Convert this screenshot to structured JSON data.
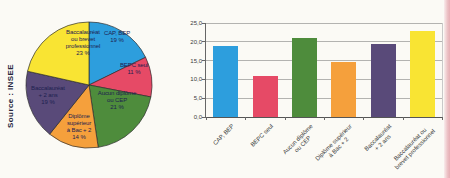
{
  "source_label": "Source : INSEE",
  "pie_slice_labels": [
    "CAP, BEP\n19 %",
    "BEPC seul\n11 %",
    "Aucun diplôme\nou CEP\n21 %",
    "Diplôme\nsupérieur\nà Bac + 2\n14 %",
    "Baccalauréat\n+ 2 ans\n19 %",
    "Baccalauréat\nou brevet\nprofessionnel\n23 %"
  ],
  "chart_data": [
    {
      "type": "pie",
      "labels": [
        "CAP, BEP",
        "BEPC seul",
        "Aucun diplôme ou CEP",
        "Diplôme supérieur à Bac + 2",
        "Baccalauréat + 2 ans",
        "Baccalauréat ou brevet professionnel"
      ],
      "values": [
        19,
        11,
        21,
        14,
        19,
        23
      ],
      "unit": "%",
      "colors": [
        "#2d9edd",
        "#e64a66",
        "#4e8c3c",
        "#f5a03c",
        "#594a79",
        "#f9e433"
      ],
      "outline_color": "#2e2e2e",
      "label_text_color": "#1d2150",
      "legend": "none",
      "note": "percentages printed inside slices"
    },
    {
      "type": "bar",
      "categories": [
        "CAP, BEP",
        "BEPC seul",
        "Aucun diplôme ou CEP",
        "Diplôme supérieur à Bac + 2",
        "Baccalauréat + 2 ans",
        "Baccalauréat ou brevet professionnel"
      ],
      "values": [
        19,
        11,
        21,
        14.5,
        19.5,
        23
      ],
      "colors": [
        "#2d9edd",
        "#e64a66",
        "#4e8c3c",
        "#f5a03c",
        "#594a79",
        "#f9e433"
      ],
      "ylim": [
        0,
        25
      ],
      "ytick_step": 5,
      "ytick_labels": [
        "0,0",
        "5,0",
        "10,0",
        "15,0",
        "20,0",
        "25,0"
      ],
      "xtick_labels": [
        "CAP, BEP",
        "BEPC seul",
        "Aucun diplôme\nou CEP",
        "Diplôme supérieur\nà Bac + 2",
        "Baccalauréat\n+ 2 ans",
        "Baccalauréat ou\nbrevet professionnel"
      ],
      "grid": true,
      "legend": "none",
      "title": ""
    }
  ]
}
